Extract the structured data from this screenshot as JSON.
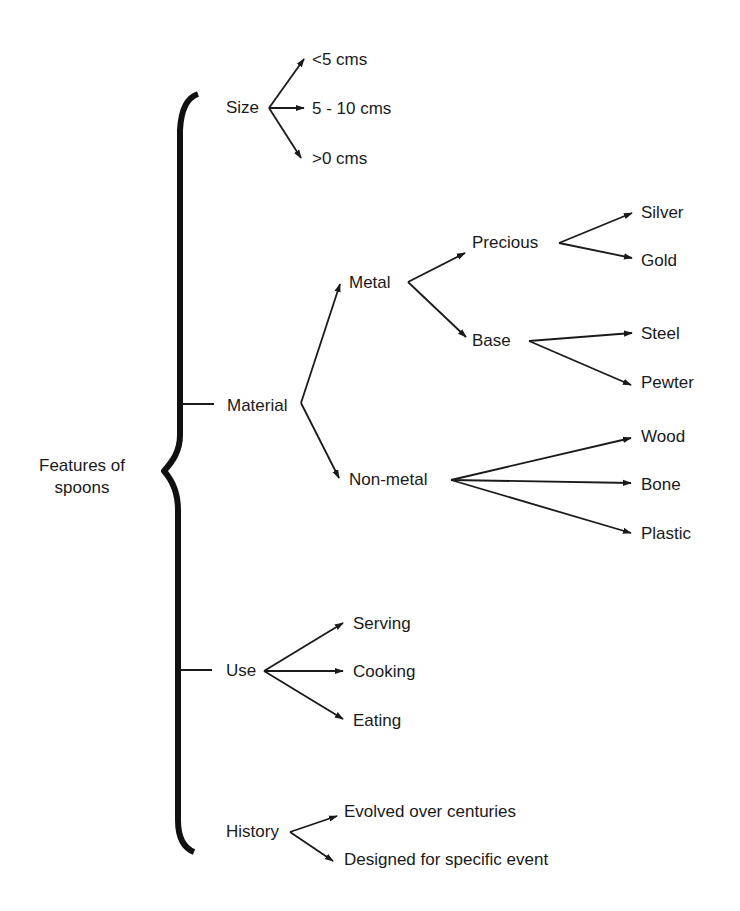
{
  "diagram": {
    "type": "tree",
    "root": {
      "label_line1": "Features of",
      "label_line2": "spoons"
    },
    "branches": {
      "size": {
        "label": "Size",
        "children": [
          "<5 cms",
          "5 - 10 cms",
          ">0 cms"
        ]
      },
      "material": {
        "label": "Material",
        "metal": {
          "label": "Metal",
          "precious": {
            "label": "Precious",
            "children": [
              "Silver",
              "Gold"
            ]
          },
          "base": {
            "label": "Base",
            "children": [
              "Steel",
              "Pewter"
            ]
          }
        },
        "non_metal": {
          "label": "Non-metal",
          "children": [
            "Wood",
            "Bone",
            "Plastic"
          ]
        }
      },
      "use": {
        "label": "Use",
        "children": [
          "Serving",
          "Cooking",
          "Eating"
        ]
      },
      "history": {
        "label": "History",
        "children": [
          "Evolved over centuries",
          "Designed for specific event"
        ]
      }
    },
    "colors": {
      "ink": "#1a1a1a",
      "background": "#ffffff"
    }
  }
}
